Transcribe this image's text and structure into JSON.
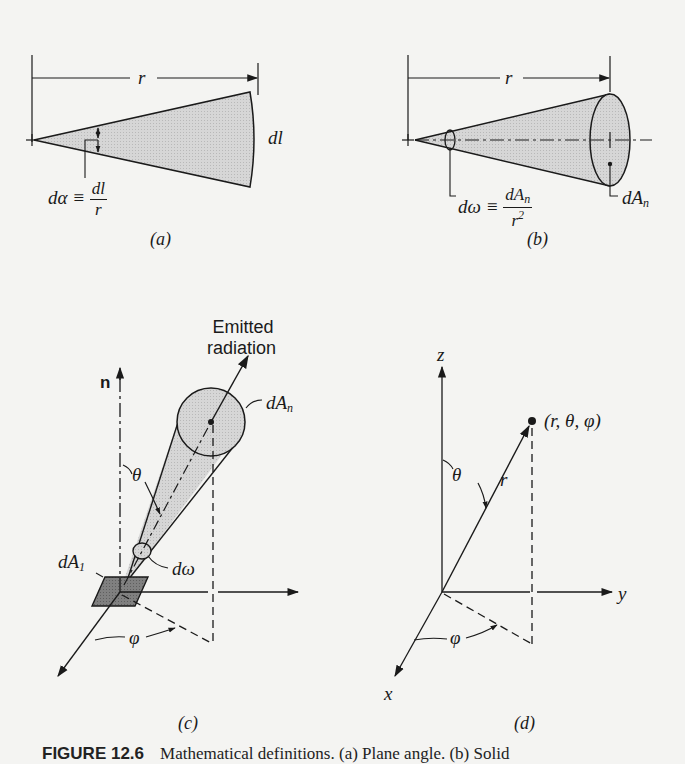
{
  "figure": {
    "caption_label": "FIGURE 12.6",
    "caption_text": "Mathematical definitions. (a) Plane angle. (b) Solid",
    "panels": {
      "a": {
        "label": "(a)",
        "radius_label": "r",
        "arc_length_label": "dl",
        "angle_symbol": "dα ≡",
        "angle_num": "dl",
        "angle_den": "r"
      },
      "b": {
        "label": "(b)",
        "radius_label": "r",
        "solid_angle_symbol": "dω ≡",
        "solid_angle_num": "dA",
        "solid_angle_num_sub": "n",
        "solid_angle_den": "r",
        "solid_angle_den_sup": "2",
        "area_label": "dA",
        "area_sub": "n"
      },
      "c": {
        "label": "(c)",
        "emitted_line1": "Emitted",
        "emitted_line2": "radiation",
        "normal_label": "n",
        "area_n_label": "dA",
        "area_n_sub": "n",
        "theta_label": "θ",
        "domega_label": "dω",
        "area1_label": "dA",
        "area1_sub": "1",
        "phi_label": "φ"
      },
      "d": {
        "label": "(d)",
        "z_label": "z",
        "y_label": "y",
        "x_label": "x",
        "point_label": "(r, θ, φ)",
        "r_label": "r",
        "theta_label": "θ",
        "phi_label": "φ"
      }
    },
    "colors": {
      "ink": "#1a1a1a",
      "shade_light": "#cfcfcf",
      "shade_dark": "#7a7a7a",
      "paper": "#f4f4f2"
    }
  }
}
